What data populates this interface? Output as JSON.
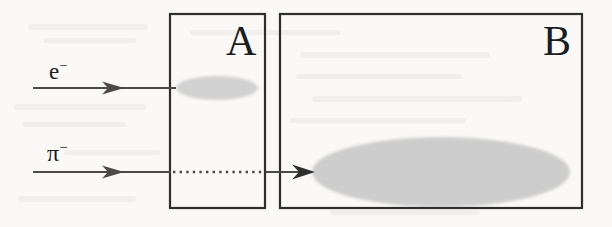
{
  "figure": {
    "kind": "particle-detector-schematic",
    "background_color": "#faf9f7",
    "ink_color": "#3a3a3a",
    "shower_fill": "#cccccc",
    "width": 612,
    "height": 227
  },
  "detectors": [
    {
      "id": "A",
      "label": "A",
      "x": 170,
      "y": 14,
      "width": 95,
      "height": 194,
      "border_color": "#2e2e2e"
    },
    {
      "id": "B",
      "label": "B",
      "x": 280,
      "y": 14,
      "width": 302,
      "height": 194,
      "border_color": "#2e2e2e"
    }
  ],
  "beams": [
    {
      "id": "electron",
      "label_base": "e",
      "label_charge": "−",
      "y": 88,
      "solid_from": 33,
      "solid_to": 176,
      "arrow_at": 118,
      "dotted": false,
      "label_x": 49,
      "label_y": 58
    },
    {
      "id": "pion",
      "label_base": "π",
      "label_charge": "−",
      "y": 172,
      "solid_from": 33,
      "solid_to": 170,
      "arrow_at": 118,
      "dotted": true,
      "dotted_from": 172,
      "dotted_to": 264,
      "exit_solid_from": 266,
      "exit_solid_to": 314,
      "exit_arrow_at": 312,
      "label_x": 47,
      "label_y": 140
    }
  ],
  "showers": [
    {
      "id": "em-shower",
      "in_detector": "A",
      "cx": 217,
      "cy": 88,
      "rx": 41,
      "ry": 12,
      "fill": "#d2d2d2"
    },
    {
      "id": "hadronic-shower",
      "in_detector": "B",
      "cx": 441,
      "cy": 172,
      "rx": 129,
      "ry": 35,
      "fill": "#cdcdcd"
    }
  ]
}
